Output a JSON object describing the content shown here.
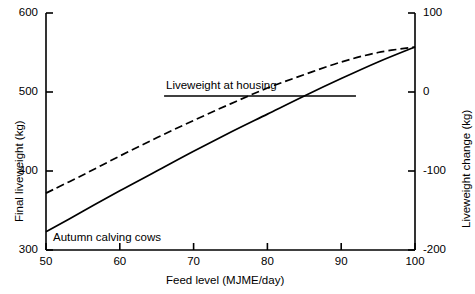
{
  "chart_data": {
    "type": "line",
    "title": "",
    "xlabel": "Feed level (MJME/day)",
    "ylabel": "Final liveweight (kg)",
    "y2label": "Liveweight change (kg)",
    "xlim": [
      50,
      100
    ],
    "ylim": [
      300,
      600
    ],
    "y2lim": [
      -200,
      100
    ],
    "xticks": [
      50,
      60,
      70,
      80,
      90,
      100
    ],
    "xticklabels": [
      "50",
      "60",
      "70",
      "80",
      "90",
      "100"
    ],
    "yticks": [
      300,
      400,
      500,
      600
    ],
    "yticklabels": [
      "300",
      "400",
      "500",
      "600"
    ],
    "y2ticks": [
      -200,
      -100,
      0,
      100
    ],
    "y2ticklabels": [
      "-200",
      "-100",
      "0",
      "100"
    ],
    "grid": false,
    "legend": "none",
    "series": [
      {
        "name": "Autumn calving cows (dashed)",
        "style": "dashed",
        "x": [
          50,
          55,
          60,
          65,
          70,
          75,
          80,
          85,
          90,
          95,
          100
        ],
        "values": [
          372,
          395,
          419,
          442,
          464,
          485,
          505,
          522,
          538,
          550,
          557
        ]
      },
      {
        "name": "Autumn calving cows (solid)",
        "style": "solid",
        "x": [
          50,
          55,
          60,
          65,
          70,
          75,
          80,
          85,
          90,
          95,
          100
        ],
        "values": [
          323,
          349,
          375,
          400,
          425,
          449,
          472,
          495,
          517,
          538,
          557
        ]
      }
    ],
    "annotations": [
      {
        "name": "liveweight-at-housing",
        "label": "Liveweight at housing",
        "type": "hline",
        "y_value": 495,
        "x_start": 66,
        "x_end": 92
      },
      {
        "name": "autumn-calving-cows",
        "label": "Autumn calving cows",
        "type": "text",
        "x_value": 54.5,
        "y_value": 317
      }
    ],
    "colors": {
      "axis": "#000000",
      "curve": "#000000",
      "annotation_line": "#000000"
    }
  }
}
